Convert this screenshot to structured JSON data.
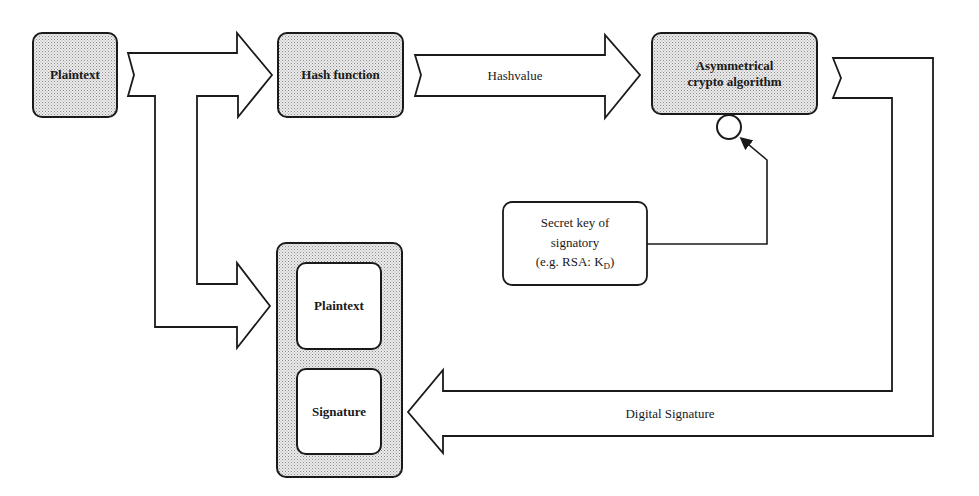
{
  "diagram": {
    "nodes": {
      "plaintext_source": {
        "label": "Plaintext"
      },
      "hash_function": {
        "label": "Hash function"
      },
      "asym_algorithm": {
        "label_line1": "Asymmetrical",
        "label_line2": "crypto algorithm"
      },
      "secret_key": {
        "line1": "Secret key of",
        "line2": "signatory",
        "line3_prefix": "(e.g. RSA: K",
        "line3_sub": "D",
        "line3_suffix": ")"
      },
      "output_container": {
        "plaintext": {
          "label": "Plaintext"
        },
        "signature": {
          "label": "Signature"
        }
      }
    },
    "arrows": {
      "hashvalue": {
        "label": "Hashvalue"
      },
      "digital_signature": {
        "label": "Digital Signature"
      }
    },
    "colors": {
      "stroke": "#1a1a1a",
      "fill_shaded": "#d6d6d6",
      "fill_arrow": "#ffffff"
    }
  }
}
